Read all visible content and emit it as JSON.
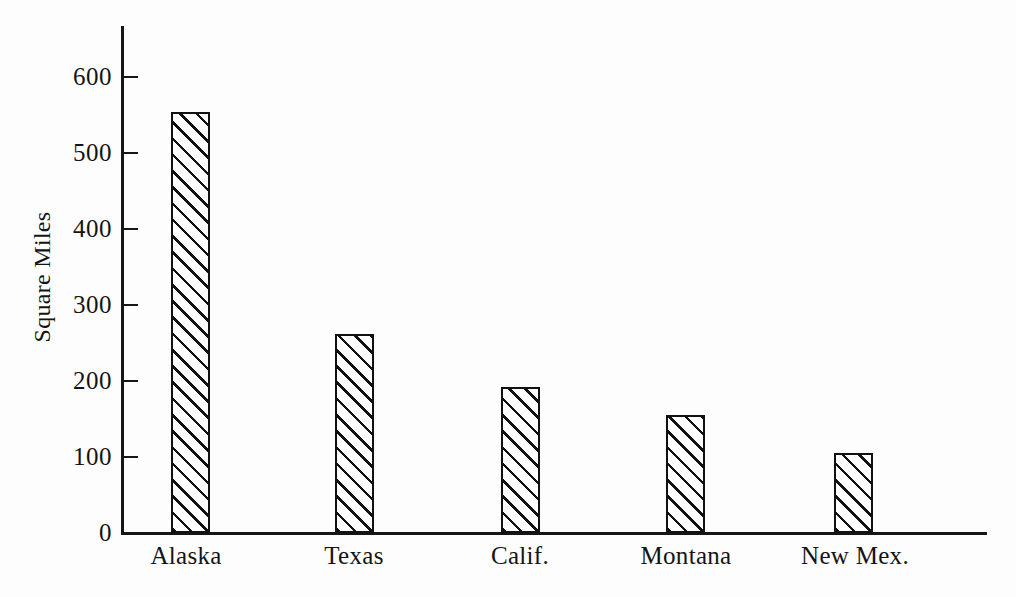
{
  "chart_data": {
    "type": "bar",
    "title": "",
    "subtitle": "",
    "xlabel": "",
    "ylabel": "Square Miles",
    "categories": [
      "Alaska",
      "Texas",
      "Calif.",
      "Montana",
      "New Mex."
    ],
    "values": [
      553,
      262,
      192,
      156,
      106
    ],
    "ylim": [
      0,
      650
    ],
    "y_ticks": [
      0,
      100,
      200,
      300,
      400,
      500,
      600
    ],
    "y_tick_labels": [
      "0",
      "100",
      "200",
      "300",
      "400",
      "500",
      "600"
    ],
    "grid": false,
    "legend": null,
    "series": [
      {
        "name": "Square Miles",
        "values": [
          553,
          262,
          192,
          156,
          106
        ]
      }
    ],
    "style": {
      "bar_fill": "diagonal-hatch",
      "bar_border_color": "#111111",
      "background_color": "#fdfdfd",
      "text_color": "#141414"
    }
  },
  "axes": {
    "y_axis_title": "Square Miles",
    "y_tick_labels": [
      "600",
      "500",
      "400",
      "300",
      "200",
      "100",
      "0"
    ],
    "x_tick_labels": [
      "Alaska",
      "Texas",
      "Calif.",
      "Montana",
      "New Mex."
    ]
  }
}
